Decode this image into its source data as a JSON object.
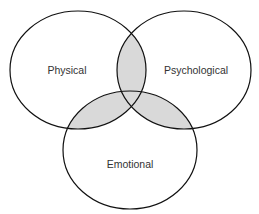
{
  "diagram": {
    "type": "venn",
    "sets": [
      {
        "id": "physical",
        "label": "Physical",
        "cx": 78,
        "cy": 70,
        "rx": 68,
        "ry": 59,
        "label_x": 67,
        "label_y": 74
      },
      {
        "id": "psychological",
        "label": "Psychological",
        "cx": 184,
        "cy": 70,
        "rx": 67,
        "ry": 59,
        "label_x": 196,
        "label_y": 74
      },
      {
        "id": "emotional",
        "label": "Emotional",
        "cx": 130,
        "cy": 150,
        "rx": 67,
        "ry": 59,
        "label_x": 130,
        "label_y": 168
      }
    ],
    "overlap_fill": "#d9d9d9",
    "stroke_color": "#111111",
    "background": "#ffffff"
  }
}
